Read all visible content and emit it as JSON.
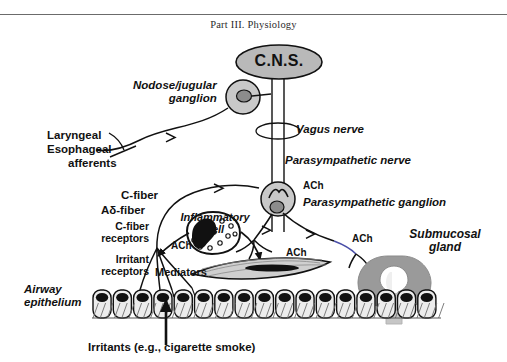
{
  "page": {
    "running_head": "Part III.  Physiology",
    "background_color": "#ffffff",
    "ink_color": "#111111",
    "gray_fill": "#a8a8a8",
    "light_gray_fill": "#d9d9d9",
    "accent_blue": "#4a4fa8"
  },
  "diagram": {
    "title_hidden": "Neural control of the airway",
    "nodes": {
      "cns": {
        "label": "C.N.S.",
        "shape": "ellipse",
        "fill": "#b9b9b9"
      },
      "nodose_ganglion": {
        "label": "Nodose/jugular\nganglion",
        "line1": "Nodose/jugular",
        "line2": "ganglion",
        "shape": "circle-with-nucleus",
        "fill": "#c9c9c9"
      },
      "parasympathetic_ganglion": {
        "label": "Parasympathetic ganglion",
        "shape": "circle-with-nucleus",
        "fill": "#c9c9c9"
      },
      "inflammatory_cell": {
        "line1": "Inflammatory",
        "line2": "cell",
        "shape": "granulated-cell-with-kidney-nucleus"
      },
      "submucosal_gland": {
        "line1": "Submucosal",
        "line2": "gland",
        "shape": "gland-bulb-with-duct",
        "fill": "#9a9a9a"
      },
      "smooth_muscle": {
        "label": "smooth muscle cell",
        "shape": "spindle",
        "fill": "#cfcfcf"
      },
      "airway_epithelium": {
        "line1": "Airway",
        "line2": "epithelium",
        "shape": "columnar-cell-row",
        "cell_count": 17
      }
    },
    "labels": {
      "vagus_nerve": "Vagus nerve",
      "parasympathetic_nerve": "Parasympathetic nerve",
      "parasympathetic_ganglion": "Parasympathetic ganglion",
      "laryngeal": "Laryngeal",
      "esophageal": "Esophageal",
      "afferents": "afferents",
      "c_fiber": "C-fiber",
      "a_delta_fiber": "Aδ-fiber",
      "c_fiber_receptors_l1": "C-fiber",
      "c_fiber_receptors_l2": "receptors",
      "irritant_receptors_l1": "Irritant",
      "irritant_receptors_l2": "receptors",
      "mediators": "Mediators",
      "irritants": "Irritants (e.g., cigarette smoke)",
      "ach_ganglion": "ACh",
      "ach_muscle": "ACh",
      "ach_gland": "ACh"
    }
  }
}
